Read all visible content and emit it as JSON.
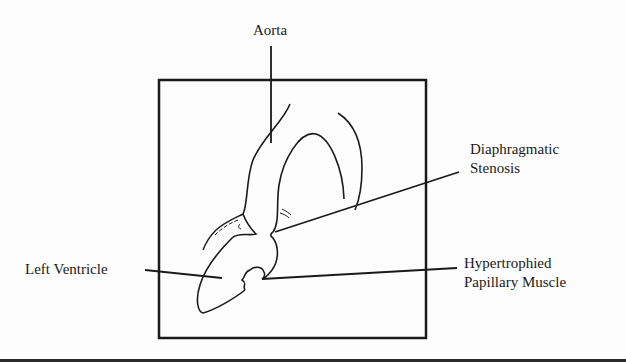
{
  "diagram": {
    "type": "anatomical line drawing",
    "labels": {
      "aorta": "Aorta",
      "stenosis_line1": "Diaphragmatic",
      "stenosis_line2": "Stenosis",
      "left_ventricle": "Left Ventricle",
      "papillary_line1": "Hypertrophied",
      "papillary_line2": "Papillary Muscle"
    },
    "colors": {
      "ink": "#1a1a1a",
      "background": "#fdfdfd",
      "bottom_band": "#2a2a2a"
    }
  }
}
